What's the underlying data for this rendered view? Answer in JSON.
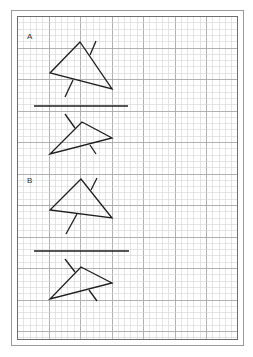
{
  "sheet": {
    "outer_border": {
      "x": 11,
      "y": 10,
      "w": 232,
      "h": 335,
      "color": "#9a9a9a"
    },
    "inner_border": {
      "x": 17,
      "y": 16,
      "w": 220,
      "h": 323,
      "color": "#6e6e6e"
    },
    "grid": {
      "minor_spacing": 6.3,
      "major_every": 5,
      "minor_color": "#d4d4d4",
      "major_color": "#a8a8a8"
    },
    "stroke_color": "#1e1e1e"
  },
  "sections": [
    {
      "label": "A",
      "label_pos": {
        "x": 27,
        "y": 33
      },
      "upper_triangle": {
        "points": [
          [
            80,
            42
          ],
          [
            50,
            73
          ],
          [
            112,
            89
          ]
        ],
        "ticks": [
          [
            [
              96,
              41
            ],
            [
              90,
              55
            ]
          ],
          [
            [
              73,
              80
            ],
            [
              65,
              97
            ]
          ]
        ]
      },
      "divider": {
        "x1": 34,
        "y1": 106,
        "x2": 128,
        "y2": 106
      },
      "lower_triangle": {
        "points": [
          [
            82,
            122
          ],
          [
            112,
            138
          ],
          [
            50,
            154
          ]
        ],
        "ticks": [
          [
            [
              65,
              114
            ],
            [
              75,
              128
            ]
          ],
          [
            [
              90,
              145
            ],
            [
              96,
              154
            ]
          ]
        ]
      }
    },
    {
      "label": "B",
      "label_pos": {
        "x": 27,
        "y": 177
      },
      "upper_triangle": {
        "points": [
          [
            81,
            179
          ],
          [
            50,
            210
          ],
          [
            112,
            218
          ]
        ],
        "ticks": [
          [
            [
              97,
              178
            ],
            [
              91,
              190
            ]
          ],
          [
            [
              77,
              214
            ],
            [
              66,
              234
            ]
          ]
        ]
      },
      "divider": {
        "x1": 34,
        "y1": 251,
        "x2": 129,
        "y2": 251
      },
      "lower_triangle": {
        "points": [
          [
            81,
            267
          ],
          [
            112,
            283
          ],
          [
            50,
            299
          ]
        ],
        "ticks": [
          [
            [
              65,
              259
            ],
            [
              75,
              272
            ]
          ],
          [
            [
              89,
              290
            ],
            [
              97,
              301
            ]
          ]
        ]
      }
    }
  ]
}
